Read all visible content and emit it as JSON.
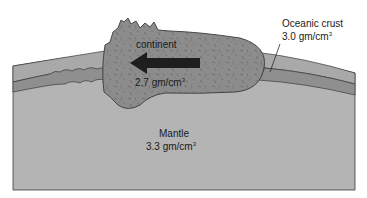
{
  "diagram": {
    "continent": {
      "label": "continent",
      "density": "2.7 gm/cm",
      "density_unit_exponent": "3",
      "motion": "arrow pointing left"
    },
    "oceanic_crust": {
      "label": "Oceanic crust",
      "density": "3.0 gm/cm",
      "density_unit_exponent": "3"
    },
    "mantle": {
      "label": "Mantle",
      "density": "3.3 gm/cm",
      "density_unit_exponent": "3"
    },
    "colors": {
      "mantle": "#b4b4b4",
      "upper_crust_band": "#a9a9a9",
      "oceanic_crust_band": "#8f8f8f",
      "continent": "#8a8a8a",
      "arrow": "#1e1e1e",
      "outline": "#3a3a3a"
    }
  }
}
